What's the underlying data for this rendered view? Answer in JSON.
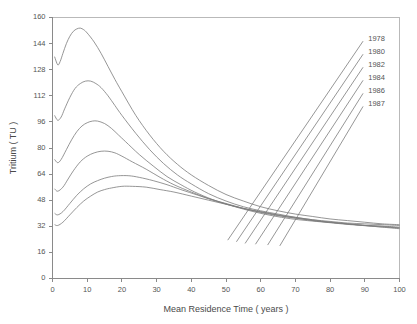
{
  "chart_data": {
    "type": "line",
    "title": "",
    "xlabel": "Mean Residence Time ( years )",
    "ylabel": "Tritium ( TU )",
    "xlim": [
      0,
      100
    ],
    "ylim": [
      0,
      160
    ],
    "xticks": [
      0,
      10,
      20,
      30,
      40,
      50,
      60,
      70,
      80,
      90,
      100
    ],
    "yticks": [
      0,
      16,
      32,
      48,
      64,
      80,
      96,
      112,
      128,
      144,
      160
    ],
    "grid": false,
    "legend_position": "inside-top-right",
    "legend_style": "leader-lines-to-curve-ends",
    "line_color": "#7b7b7b",
    "series": [
      {
        "name": "1978",
        "label_x": 91,
        "label_y": 147,
        "points": [
          [
            0.6,
            136
          ],
          [
            1.5,
            131
          ],
          [
            2.2,
            133
          ],
          [
            3,
            138
          ],
          [
            4,
            144
          ],
          [
            5,
            148.5
          ],
          [
            6,
            151.5
          ],
          [
            7,
            153
          ],
          [
            8,
            153.5
          ],
          [
            9,
            152.5
          ],
          [
            10,
            150.5
          ],
          [
            12,
            145
          ],
          [
            14,
            138
          ],
          [
            16,
            130
          ],
          [
            18,
            122
          ],
          [
            20,
            114.5
          ],
          [
            24,
            100
          ],
          [
            28,
            88
          ],
          [
            32,
            78
          ],
          [
            36,
            70
          ],
          [
            40,
            63.5
          ],
          [
            45,
            57
          ],
          [
            50,
            51.5
          ],
          [
            55,
            47.5
          ],
          [
            60,
            44
          ],
          [
            65,
            41.5
          ],
          [
            70,
            39.5
          ],
          [
            75,
            38
          ],
          [
            80,
            36.5
          ],
          [
            85,
            35.5
          ],
          [
            90,
            34.5
          ],
          [
            95,
            33.5
          ],
          [
            100,
            33
          ]
        ]
      },
      {
        "name": "1980",
        "label_x": 91,
        "label_y": 139,
        "points": [
          [
            0.6,
            100
          ],
          [
            1.5,
            97
          ],
          [
            2.5,
            99
          ],
          [
            3.5,
            104
          ],
          [
            5,
            111
          ],
          [
            6.5,
            116.5
          ],
          [
            8,
            119.5
          ],
          [
            9.5,
            121
          ],
          [
            11,
            121
          ],
          [
            12.5,
            119.5
          ],
          [
            14,
            117
          ],
          [
            16,
            112
          ],
          [
            18,
            106
          ],
          [
            20,
            100
          ],
          [
            24,
            89
          ],
          [
            28,
            79
          ],
          [
            32,
            70.5
          ],
          [
            36,
            63.5
          ],
          [
            40,
            58
          ],
          [
            45,
            52
          ],
          [
            50,
            47.5
          ],
          [
            55,
            44
          ],
          [
            60,
            41.5
          ],
          [
            65,
            39.5
          ],
          [
            70,
            37.5
          ],
          [
            75,
            36
          ],
          [
            80,
            35
          ],
          [
            85,
            34
          ],
          [
            90,
            33.5
          ],
          [
            95,
            33
          ],
          [
            100,
            32.5
          ]
        ]
      },
      {
        "name": "1982",
        "label_x": 91,
        "label_y": 131,
        "points": [
          [
            0.6,
            73
          ],
          [
            1.5,
            71
          ],
          [
            2.5,
            73
          ],
          [
            4,
            79
          ],
          [
            5.5,
            85
          ],
          [
            7,
            90
          ],
          [
            8.5,
            93.5
          ],
          [
            10,
            95.5
          ],
          [
            11.5,
            96.5
          ],
          [
            13,
            96.5
          ],
          [
            15,
            95
          ],
          [
            17,
            92
          ],
          [
            19,
            88
          ],
          [
            21,
            84
          ],
          [
            25,
            76
          ],
          [
            29,
            69
          ],
          [
            33,
            62.5
          ],
          [
            37,
            57.5
          ],
          [
            41,
            53
          ],
          [
            46,
            48.5
          ],
          [
            51,
            45
          ],
          [
            56,
            42
          ],
          [
            61,
            39.5
          ],
          [
            66,
            37.5
          ],
          [
            71,
            36
          ],
          [
            76,
            35
          ],
          [
            81,
            34
          ],
          [
            86,
            33
          ],
          [
            91,
            32.5
          ],
          [
            96,
            32
          ],
          [
            100,
            31.5
          ]
        ]
      },
      {
        "name": "1984",
        "label_x": 91,
        "label_y": 123,
        "points": [
          [
            0.6,
            55
          ],
          [
            1.5,
            53.5
          ],
          [
            3,
            56
          ],
          [
            4.5,
            61
          ],
          [
            6,
            66
          ],
          [
            8,
            71.5
          ],
          [
            10,
            75
          ],
          [
            12,
            77
          ],
          [
            14,
            78
          ],
          [
            16,
            78
          ],
          [
            18,
            77
          ],
          [
            20,
            75
          ],
          [
            23,
            71.5
          ],
          [
            27,
            67
          ],
          [
            31,
            62
          ],
          [
            35,
            57.5
          ],
          [
            40,
            53
          ],
          [
            45,
            49
          ],
          [
            50,
            46
          ],
          [
            55,
            43
          ],
          [
            60,
            40.5
          ],
          [
            65,
            38.5
          ],
          [
            70,
            37
          ],
          [
            75,
            35.5
          ],
          [
            80,
            34.5
          ],
          [
            85,
            33.5
          ],
          [
            90,
            32.5
          ],
          [
            95,
            32
          ],
          [
            100,
            31
          ]
        ]
      },
      {
        "name": "1986",
        "label_x": 91,
        "label_y": 115,
        "points": [
          [
            0.6,
            40
          ],
          [
            1.5,
            39
          ],
          [
            3,
            41
          ],
          [
            5,
            46
          ],
          [
            7,
            51
          ],
          [
            9,
            55
          ],
          [
            11,
            58
          ],
          [
            13,
            60
          ],
          [
            15,
            61.5
          ],
          [
            17,
            62.5
          ],
          [
            19,
            63
          ],
          [
            22,
            63
          ],
          [
            25,
            62
          ],
          [
            29,
            60
          ],
          [
            33,
            57.5
          ],
          [
            37,
            54.5
          ],
          [
            42,
            51
          ],
          [
            47,
            47.5
          ],
          [
            52,
            44.5
          ],
          [
            57,
            42
          ],
          [
            62,
            40
          ],
          [
            67,
            38
          ],
          [
            72,
            36.5
          ],
          [
            77,
            35
          ],
          [
            82,
            34
          ],
          [
            87,
            33
          ],
          [
            92,
            32
          ],
          [
            100,
            31
          ]
        ]
      },
      {
        "name": "1987",
        "label_x": 91,
        "label_y": 107,
        "points": [
          [
            0.6,
            33
          ],
          [
            1.5,
            32.5
          ],
          [
            3,
            34.5
          ],
          [
            5,
            39
          ],
          [
            7,
            43.5
          ],
          [
            9,
            47.5
          ],
          [
            11,
            50.5
          ],
          [
            13,
            53
          ],
          [
            15,
            54.5
          ],
          [
            17,
            55.5
          ],
          [
            20,
            56.5
          ],
          [
            23,
            56.5
          ],
          [
            27,
            56
          ],
          [
            31,
            54.5
          ],
          [
            35,
            53
          ],
          [
            40,
            50.5
          ],
          [
            45,
            48
          ],
          [
            50,
            45.5
          ],
          [
            55,
            43
          ],
          [
            60,
            41
          ],
          [
            65,
            39
          ],
          [
            70,
            37.5
          ],
          [
            75,
            36
          ],
          [
            80,
            34.5
          ],
          [
            85,
            33.5
          ],
          [
            90,
            32.5
          ],
          [
            95,
            31.5
          ],
          [
            100,
            30.5
          ]
        ]
      }
    ],
    "leader_lines": [
      {
        "name": "leader-1978",
        "from": [
          50.5,
          23.5
        ],
        "to": [
          89.5,
          145.5
        ]
      },
      {
        "name": "leader-1980",
        "from": [
          53.0,
          22.5
        ],
        "to": [
          89.5,
          137.5
        ]
      },
      {
        "name": "leader-1982",
        "from": [
          55.5,
          21.5
        ],
        "to": [
          89.5,
          129.5
        ]
      },
      {
        "name": "leader-1984",
        "from": [
          58.5,
          21.0
        ],
        "to": [
          89.5,
          121.5
        ]
      },
      {
        "name": "leader-1986",
        "from": [
          62.0,
          20.5
        ],
        "to": [
          89.5,
          113.5
        ]
      },
      {
        "name": "leader-1987",
        "from": [
          65.5,
          20.0
        ],
        "to": [
          89.5,
          105.5
        ]
      }
    ]
  }
}
